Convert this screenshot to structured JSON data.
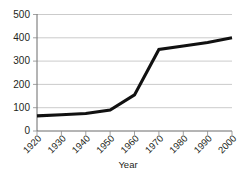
{
  "chart_data": {
    "type": "line",
    "title": "",
    "xlabel": "Year",
    "ylabel": "",
    "x": [
      1920,
      1930,
      1940,
      1950,
      1960,
      1970,
      1980,
      1990,
      2000
    ],
    "categories": [
      "1920",
      "1930",
      "1940",
      "1950",
      "1960",
      "1970",
      "1980",
      "1990",
      "2000"
    ],
    "values": [
      65,
      70,
      75,
      90,
      155,
      350,
      365,
      380,
      400
    ],
    "series": [
      {
        "name": "series-1",
        "values": [
          65,
          70,
          75,
          90,
          155,
          350,
          365,
          380,
          400
        ],
        "color": "#111111"
      }
    ],
    "xlim": [
      1920,
      2000
    ],
    "ylim": [
      0,
      500
    ],
    "yticks": [
      0,
      100,
      200,
      300,
      400,
      500
    ],
    "ytick_labels": [
      "0",
      "100",
      "200",
      "300",
      "400",
      "500"
    ],
    "xtick_labels": [
      "1920",
      "1930",
      "1940",
      "1950",
      "1960",
      "1970",
      "1980",
      "1990",
      "2000"
    ],
    "grid": true,
    "grid_axis": "y",
    "legend": false,
    "legend_position": "none",
    "xtick_label_rotation": -45
  },
  "axes": {
    "y_labels": [
      {
        "value": "500"
      },
      {
        "value": "400"
      },
      {
        "value": "300"
      },
      {
        "value": "200"
      },
      {
        "value": "100"
      },
      {
        "value": "0"
      }
    ],
    "x_labels": [
      {
        "value": "1920"
      },
      {
        "value": "1930"
      },
      {
        "value": "1940"
      },
      {
        "value": "1950"
      },
      {
        "value": "1960"
      },
      {
        "value": "1970"
      },
      {
        "value": "1980"
      },
      {
        "value": "1990"
      },
      {
        "value": "2000"
      }
    ],
    "x_title": "Year"
  },
  "colors": {
    "line": "#111111",
    "grid": "#b5b5b5",
    "axis": "#5a5a5a",
    "text": "#231f20",
    "background": "#ffffff"
  }
}
